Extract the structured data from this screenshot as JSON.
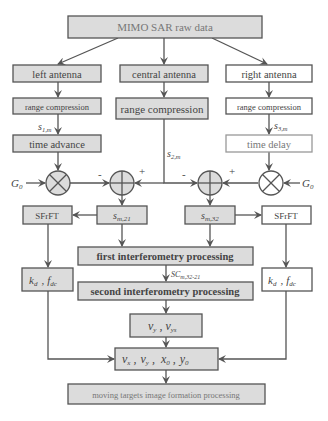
{
  "colors": {
    "box_fill": "#dcdcdc",
    "box_white": "#ffffff",
    "stroke": "#555555",
    "text": "#444444"
  },
  "nodes": {
    "raw_data": "MIMO SAR raw data",
    "left_antenna": "left antenna",
    "central_antenna": "central antenna",
    "right_antenna": "right antenna",
    "left_range": "range compression",
    "central_range": "range compression",
    "right_range": "range compression",
    "time_advance": "time advance",
    "time_delay": "time delay",
    "sfrft_left": "SFrFT",
    "sfrft_right": "SFrFT",
    "s_m21": "s",
    "s_m21_sub": "m,21",
    "s_m32": "s",
    "s_m32_sub": "m,32",
    "first_interf": "first interferometry processing",
    "second_interf": "second interferometry processing",
    "kd_left": "k",
    "kd_left_sub": "d",
    "fdc_left": "f",
    "fdc_left_sub": "dc",
    "kd_right": "k",
    "kd_right_sub": "d",
    "fdc_right": "f",
    "fdc_right_sub": "dc",
    "vy_box": "v",
    "vy_sub": "y",
    "vys_sub": "ys",
    "params": {
      "vx": "v",
      "vx_sub": "x",
      "vy": "v",
      "vy_sub": "y",
      "x0": "x",
      "x0_sub": "0",
      "y0": "y",
      "y0_sub": "0"
    },
    "final": "moving targets image formation processing"
  },
  "labels": {
    "s1m": "s",
    "s1m_sub": "1,m",
    "s2m": "s",
    "s2m_sub": "2,m",
    "s3m": "s",
    "s3m_sub": "3,m",
    "G0_left": "G",
    "G0_left_sub": "0",
    "G0_right": "G",
    "G0_right_sub": "0",
    "minus_left": "-",
    "plus_left": "+",
    "minus_right": "-",
    "plus_right": "+",
    "sc": "SC",
    "sc_sub": "m,32-21",
    "comma": ","
  }
}
